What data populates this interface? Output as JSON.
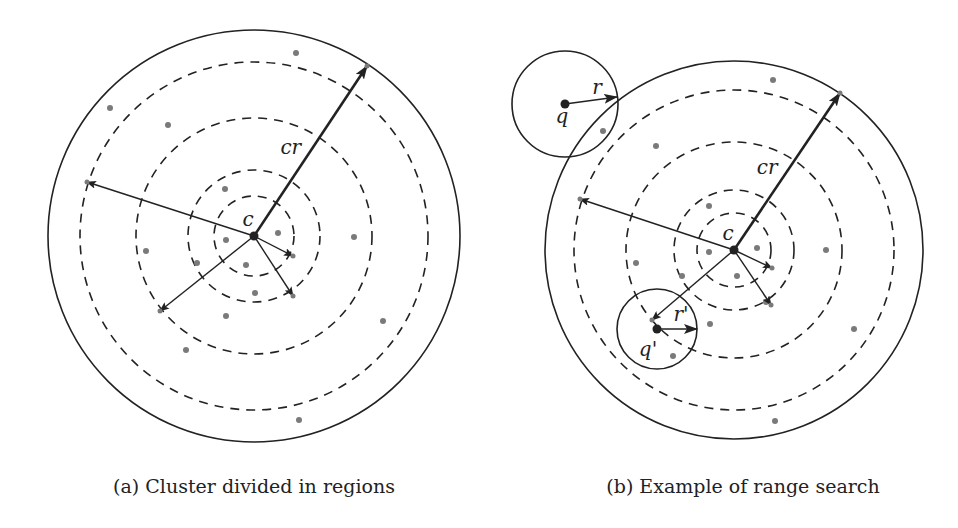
{
  "figure": {
    "colors": {
      "ink": "#222222",
      "point": "#7a7a7a",
      "background": "#ffffff"
    },
    "panels": [
      {
        "id": "a",
        "caption": "(a) Cluster divided in regions",
        "center_label": "c",
        "radius_label": "cr",
        "center": [
          254,
          236
        ],
        "outer_radius": 206,
        "dashed_radii": [
          174,
          118,
          66,
          40
        ],
        "arrows": [
          {
            "to": [
              367,
              66
            ],
            "thick": true
          },
          {
            "to": [
              87,
              182
            ],
            "thick": false
          },
          {
            "to": [
              160,
              311
            ],
            "thick": false
          },
          {
            "to": [
              293,
              256
            ],
            "thick": false
          },
          {
            "to": [
              293,
              296
            ],
            "thick": false
          }
        ],
        "points": [
          [
            296,
            53
          ],
          [
            110,
            108
          ],
          [
            168,
            125
          ],
          [
            225,
            189
          ],
          [
            226,
            240
          ],
          [
            278,
            233
          ],
          [
            354,
            237
          ],
          [
            146,
            251
          ],
          [
            197,
            263
          ],
          [
            246,
            265
          ],
          [
            255,
            293
          ],
          [
            226,
            316
          ],
          [
            383,
            321
          ],
          [
            186,
            350
          ],
          [
            299,
            420
          ]
        ]
      },
      {
        "id": "b",
        "caption": "(b) Example of range search",
        "center_label": "c",
        "radius_label": "cr",
        "query_label": "q",
        "query_radius_label": "r",
        "query2_label": "q'",
        "query2_radius_label": "r'",
        "center": [
          734,
          250
        ],
        "outer_radius": 189,
        "dashed_radii": [
          160,
          108,
          60,
          37
        ],
        "query": {
          "center": [
            565,
            104
          ],
          "radius": 53,
          "arrow_to": [
            617,
            97
          ]
        },
        "query2": {
          "center": [
            657,
            329
          ],
          "radius": 40,
          "arrow_to": [
            697,
            329
          ]
        },
        "arrows": [
          {
            "to": [
              840,
              93
            ],
            "thick": true
          },
          {
            "to": [
              580,
              199
            ],
            "thick": false
          },
          {
            "to": [
              652,
              320
            ],
            "thick": false
          },
          {
            "to": [
              772,
              268
            ],
            "thick": false
          },
          {
            "to": [
              771,
              305
            ],
            "thick": false
          }
        ],
        "points": [
          [
            773,
            80
          ],
          [
            603,
            131
          ],
          [
            656,
            146
          ],
          [
            709,
            206
          ],
          [
            709,
            252
          ],
          [
            757,
            248
          ],
          [
            826,
            250
          ],
          [
            636,
            263
          ],
          [
            682,
            276
          ],
          [
            737,
            276
          ],
          [
            766,
            302
          ],
          [
            710,
            324
          ],
          [
            854,
            329
          ],
          [
            673,
            356
          ],
          [
            775,
            421
          ]
        ]
      }
    ]
  }
}
